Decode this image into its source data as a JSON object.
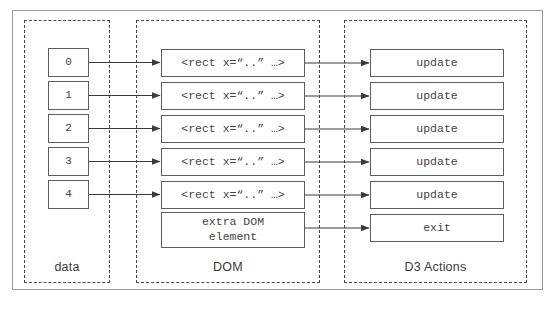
{
  "diagram": {
    "groups": [
      {
        "id": "data",
        "label": "data"
      },
      {
        "id": "dom",
        "label": "DOM"
      },
      {
        "id": "d3",
        "label": "D3 Actions"
      }
    ],
    "data_nodes": [
      {
        "label": "0"
      },
      {
        "label": "1"
      },
      {
        "label": "2"
      },
      {
        "label": "3"
      },
      {
        "label": "4"
      }
    ],
    "dom_nodes": [
      {
        "label": "<rect x=“..” …>"
      },
      {
        "label": "<rect x=“..” …>"
      },
      {
        "label": "<rect x=“..” …>"
      },
      {
        "label": "<rect x=“..” …>"
      },
      {
        "label": "<rect x=“..” …>"
      },
      {
        "label": "extra DOM\nelement"
      }
    ],
    "d3_nodes": [
      {
        "label": "update"
      },
      {
        "label": "update"
      },
      {
        "label": "update"
      },
      {
        "label": "update"
      },
      {
        "label": "update"
      },
      {
        "label": "exit"
      }
    ],
    "colors": {
      "node_border": "#5d5d5d",
      "group_border": "#4a4a4a",
      "frame_border": "#9a9a9a",
      "text": "#444444",
      "label_text": "#3a3a3a",
      "arrow": "#3a3a3a",
      "background": "#ffffff"
    }
  }
}
